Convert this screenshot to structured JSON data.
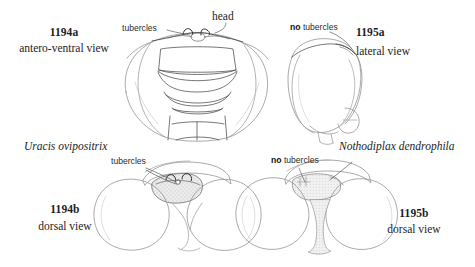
{
  "plate": {
    "title": "Odonata head comparison plate",
    "background_color": "#ffffff",
    "ink_color": "#3a3a3a",
    "shade_color": "#d9d9d9",
    "head_label": "head"
  },
  "panels": [
    {
      "id": "1194a",
      "figure_number": "1194a",
      "view": "antero-ventral view",
      "species": "Uracis ovipositrix",
      "callout": "tubercles",
      "callout_negated": false,
      "position": "top-left"
    },
    {
      "id": "1195a",
      "figure_number": "1195a",
      "view": "lateral view",
      "species": "Nothodiplax dendrophila",
      "callout_prefix": "no",
      "callout": "tubercles",
      "callout_negated": true,
      "position": "top-right"
    },
    {
      "id": "1194b",
      "figure_number": "1194b",
      "view": "dorsal view",
      "species": "Uracis ovipositrix",
      "callout": "tubercles",
      "callout_negated": false,
      "position": "bottom-left"
    },
    {
      "id": "1195b",
      "figure_number": "1195b",
      "view": "dorsal view",
      "species": "Nothodiplax dendrophila",
      "callout_prefix": "no",
      "callout": "tubercles",
      "callout_negated": true,
      "position": "bottom-right"
    }
  ],
  "species_labels": {
    "left": "Uracis ovipositrix",
    "right": "Nothodiplax dendrophila"
  },
  "callout_labels": {
    "tubercles": "tubercles",
    "no_prefix": "no",
    "no_tubercles_rest": " tubercles"
  }
}
